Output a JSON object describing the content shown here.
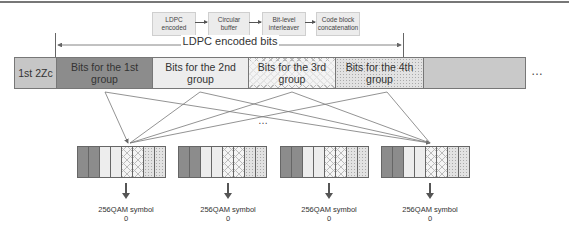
{
  "flow": {
    "steps": [
      "LDPC encoded",
      "Circular buffer",
      "Bit-level interleaver",
      "Code block concatenation"
    ]
  },
  "span_label": "LDPC encoded bits",
  "row": {
    "first": "1st 2Zc",
    "groups": [
      "Bits for the 1st group",
      "Bits for the 2nd group",
      "Bits for the 3rd group",
      "Bits for the 4th group"
    ],
    "ellipsis": "…"
  },
  "middle_ellipsis": "…",
  "symbols": [
    "256QAM symbol 0",
    "256QAM symbol 0",
    "256QAM symbol 0",
    "256QAM symbol 0"
  ],
  "colors": {
    "dark": "#8c8c8c",
    "light": "#ededed",
    "gray": "#c6c6c6",
    "line": "#666666"
  }
}
